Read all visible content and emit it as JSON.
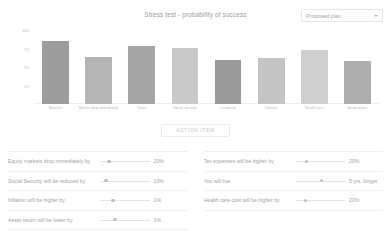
{
  "chart_header": {
    "title": "Stress test - probability of success",
    "plan_select": {
      "value": "Proposed plan",
      "caret_icon": "chevron-down-icon"
    }
  },
  "action": {
    "label": "ACTION ITEM"
  },
  "chart_data": {
    "type": "bar",
    "title": "Stress test - probability of success",
    "xlabel": "",
    "ylabel": "",
    "ylim": [
      0,
      100
    ],
    "grid": false,
    "legend": "none",
    "categories": [
      "Baseline",
      "Market drop immediately",
      "Taxes",
      "Social security",
      "Longevity",
      "Inflation",
      "Health care",
      "Asset return"
    ],
    "values": [
      85,
      64,
      79,
      76,
      59,
      62,
      73,
      58
    ],
    "yticks": [
      "100",
      "75",
      "50",
      "25"
    ],
    "ytick_values": [
      100,
      75,
      50,
      25
    ],
    "bar_colors": [
      "#9d9d9d",
      "#b4b4b4",
      "#a5a5a5",
      "#c9c9c9",
      "#9a9a9a",
      "#c4c4c4",
      "#cfcfcf",
      "#adadad"
    ]
  },
  "assumptions": {
    "left": [
      {
        "label": "Equity markets drop immediately by",
        "value": "20%",
        "handle_pct": 18
      },
      {
        "label": "Social Security will be reduced by",
        "value": "10%",
        "handle_pct": 12
      },
      {
        "label": "Inflation will be higher by",
        "value": "1%",
        "handle_pct": 26
      },
      {
        "label": "Asset return will be lower by",
        "value": "1%",
        "handle_pct": 30
      }
    ],
    "right": [
      {
        "label": "Tax expenses will be higher by",
        "value": "20%",
        "handle_pct": 22
      },
      {
        "label": "You will live",
        "value": "5 yrs. longer",
        "handle_pct": 52
      },
      {
        "label": "Health care cost will be higher by",
        "value": "20%",
        "handle_pct": 20
      }
    ]
  }
}
